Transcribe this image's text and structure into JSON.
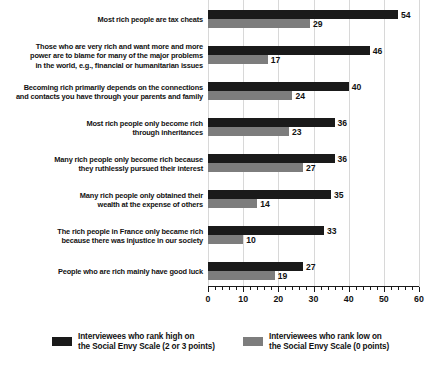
{
  "chart_data": {
    "type": "bar",
    "orientation": "horizontal",
    "title": "",
    "xlabel": "",
    "ylabel": "",
    "xlim": [
      0,
      60
    ],
    "xticks": [
      0,
      10,
      20,
      30,
      40,
      50,
      60
    ],
    "xtick_labels": [
      "0",
      "10",
      "20",
      "30",
      "40",
      "50",
      "60"
    ],
    "grid": true,
    "legend_position": "bottom",
    "categories": [
      "Most rich people are tax cheats",
      "Those who are very rich and want more and more\npower are to blame for many of the major problems\nin the world, e.g., financial or humanitarian issues",
      "Becoming rich primarily depends on the connections\nand contacts you have through your parents and family",
      "Most rich people only become rich\nthrough inheritances",
      "Many rich people only become rich because\nthey ruthlessly pursued their interest",
      "Many rich people only obtained their\nwealth at the expense of others",
      "The rich people in France only became rich\nbecause there was injustice in our society",
      "People who are rich mainly have good luck"
    ],
    "series": [
      {
        "name": "Interviewees who rank high on\nthe Social Envy Scale (2 or 3 points)",
        "color": "#1a1a1a",
        "values": [
          54,
          46,
          40,
          36,
          36,
          35,
          33,
          27
        ]
      },
      {
        "name": "Interviewees who rank low on\nthe Social Envy Scale (0 points)",
        "color": "#7d7d7d",
        "values": [
          29,
          17,
          24,
          23,
          27,
          14,
          10,
          19
        ]
      }
    ]
  },
  "legend": {
    "items": [
      {
        "label": "Interviewees who rank high on\nthe Social Envy Scale (2 or 3 points)",
        "color": "#1a1a1a"
      },
      {
        "label": "Interviewees who rank low on\nthe Social Envy Scale (0 points)",
        "color": "#7d7d7d"
      }
    ]
  }
}
